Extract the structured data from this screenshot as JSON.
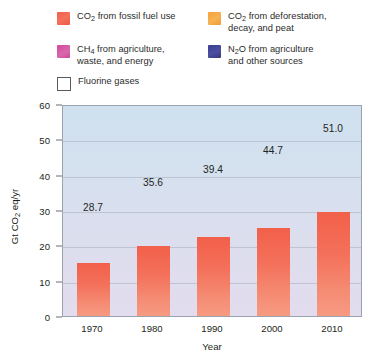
{
  "legend": {
    "items": [
      {
        "key": "fossil",
        "label_html": "CO₂ from fossil fuel use",
        "color": "#f2604a"
      },
      {
        "key": "deforest",
        "label_html": "CO₂ from deforestation, decay, and peat",
        "color": "#f49a33"
      },
      {
        "key": "methane",
        "label_html": "CH₄ from agriculture, waste, and energy",
        "color": "#c7429a"
      },
      {
        "key": "nitrous",
        "label_html": "N₂O from agriculture and other sources",
        "color": "#31356f"
      },
      {
        "key": "fluorine",
        "label_html": "Fluorine gases",
        "color": "#ffffff"
      }
    ],
    "fossil_line1": "CO",
    "fossil_sub": "2",
    "fossil_rest": " from fossil fuel use",
    "defor_line1_rest": " from deforestation,",
    "defor_line2": "decay, and peat",
    "ch4_line1_rest": " from agriculture,",
    "ch4_line2": "waste, and energy",
    "n2o_line1_rest": "O from agriculture",
    "n2o_line2": "and other sources",
    "fluorine_label": "Fluorine gases"
  },
  "chart_data": {
    "type": "bar",
    "subtype": "stacked",
    "title": "",
    "xlabel": "Year",
    "ylabel": "Gt CO2 eq/yr",
    "ylabel_pre": "Gt CO",
    "ylabel_sub": "2",
    "ylabel_post": " eq/yr",
    "categories": [
      "1970",
      "1980",
      "1990",
      "2000",
      "2010"
    ],
    "ylim": [
      0,
      60
    ],
    "yticks": [
      0,
      10,
      20,
      30,
      40,
      50,
      60
    ],
    "ytick_labels": [
      "0",
      "10",
      "20",
      "30",
      "40",
      "50",
      "60"
    ],
    "grid": true,
    "legend_position": "above",
    "totals": [
      28.7,
      35.6,
      39.4,
      44.7,
      51.0
    ],
    "total_labels": [
      "28.7",
      "35.6",
      "39.4",
      "44.7",
      "51.0"
    ],
    "series": [
      {
        "name": "CO2 from fossil fuel use",
        "key": "fossil",
        "color": "#f2604a",
        "values": [
          14.9,
          19.9,
          22.5,
          24.8,
          29.5
        ]
      },
      {
        "name": "CO2 from deforestation, decay, and peat",
        "key": "deforest",
        "color": "#f49a33",
        "values": [
          5.4,
          4.5,
          6.4,
          7.1,
          10.1
        ]
      },
      {
        "name": "CH4 from agriculture, waste, and energy",
        "key": "methane",
        "color": "#c7429a",
        "values": [
          5.1,
          6.2,
          6.2,
          7.0,
          6.5
        ]
      },
      {
        "name": "N2O from agriculture and other sources",
        "key": "nitrous",
        "color": "#31356f",
        "values": [
          2.6,
          4.3,
          3.6,
          4.9,
          4.0
        ]
      },
      {
        "name": "Fluorine gases",
        "key": "fluorine",
        "color": "#ffffff",
        "values": [
          0.7,
          0.7,
          0.7,
          0.9,
          0.9
        ]
      }
    ]
  }
}
